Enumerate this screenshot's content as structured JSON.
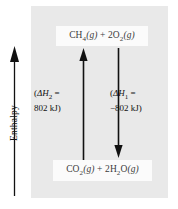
{
  "figure": {
    "name": "enthalpy-diagram",
    "axis": {
      "label": "Enthalpy",
      "arrow_direction": "up",
      "icon": "up-arrow-icon"
    },
    "species": {
      "top": {
        "formula_plain": "CH4(g) + 2O2(g)",
        "parts": {
          "a_element": "CH",
          "a_sub": "4",
          "a_state": "(g)",
          "plus": "+",
          "b_coeff": "2O",
          "b_sub": "2",
          "b_state": "(g)"
        }
      },
      "bottom": {
        "formula_plain": "CO2(g) + 2H2O(g)",
        "parts": {
          "a_element": "CO",
          "a_sub": "2",
          "a_state": "(g)",
          "plus": "+",
          "b_coeff": "2H",
          "b_sub": "2",
          "b_mid": "O",
          "b_state": "(g)"
        }
      }
    },
    "arrows": {
      "up": {
        "name": "reverse-reaction-arrow",
        "direction": "up",
        "color": "#111111"
      },
      "down": {
        "name": "forward-reaction-arrow",
        "direction": "down",
        "color": "#111111"
      }
    },
    "annotations": {
      "delta_h2": {
        "line1_open": "(",
        "line1_symbol": "ΔH",
        "line1_sub": "2",
        "line1_eq": " =",
        "line2": "802 kJ)",
        "plain": "(ΔH2 = 802 kJ)"
      },
      "delta_h1": {
        "line1_open": "(",
        "line1_symbol": "ΔH",
        "line1_sub": "1",
        "line1_eq": " =",
        "line2": "−802 kJ)",
        "plain": "(ΔH1 = −802 kJ)"
      }
    },
    "colors": {
      "panel_background": "#e9e9e9",
      "label_box_background": "#fbfbfb",
      "arrow": "#111111",
      "species_text": "#3c3c3c",
      "annotation_text": "#111111",
      "page_background": "#ffffff"
    }
  }
}
